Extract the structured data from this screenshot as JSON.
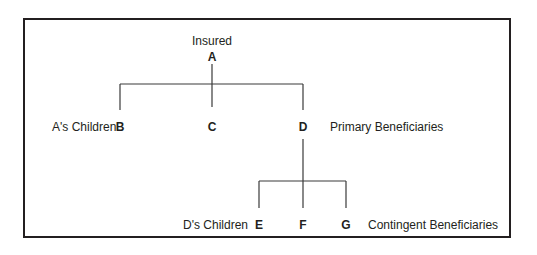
{
  "diagram": {
    "type": "beneficiary-tree",
    "insured": {
      "role_label": "Insured",
      "node": "A"
    },
    "generation_1": {
      "group_label": "A's Children",
      "nodes": [
        "B",
        "C",
        "D"
      ],
      "designation": "Primary Beneficiaries"
    },
    "generation_2": {
      "parent": "D",
      "group_label": "D's Children",
      "nodes": [
        "E",
        "F",
        "G"
      ],
      "designation": "Contingent Beneficiaries"
    },
    "edges": [
      [
        "A",
        "B"
      ],
      [
        "A",
        "C"
      ],
      [
        "A",
        "D"
      ],
      [
        "D",
        "E"
      ],
      [
        "D",
        "F"
      ],
      [
        "D",
        "G"
      ]
    ],
    "colors": {
      "line": "#231f20",
      "text": "#231f20",
      "background": "#ffffff"
    }
  }
}
